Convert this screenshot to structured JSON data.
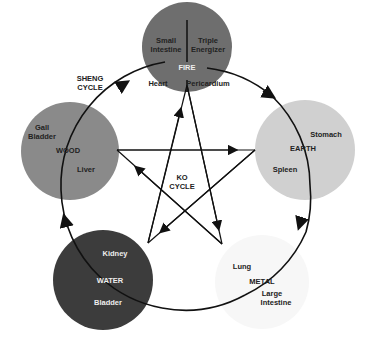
{
  "colors": {
    "fire": "#6e6e6e",
    "wood": "#8a8a8a",
    "earth": "#d0d0d0",
    "water": "#3c3c3c",
    "metal": "#f7f7f7",
    "line": "#111111",
    "dark_text": "#222222",
    "light_text": "#f2f2f2"
  },
  "cycles": {
    "sheng": {
      "line1": "SHENG",
      "line2": "CYCLE"
    },
    "ko": {
      "line1": "KO",
      "line2": "CYCLE"
    }
  },
  "elements": {
    "fire": {
      "name": "FIRE",
      "organs": [
        "Small",
        "Intestine",
        "Triple",
        "Energizer",
        "Heart",
        "Pericardium"
      ]
    },
    "earth": {
      "name": "EARTH",
      "organs": [
        "Stomach",
        "Spleen"
      ]
    },
    "metal": {
      "name": "METAL",
      "organs": [
        "Lung",
        "Large",
        "Intestine"
      ]
    },
    "water": {
      "name": "WATER",
      "organs": [
        "Kidney",
        "Bladder"
      ]
    },
    "wood": {
      "name": "WOOD",
      "organs": [
        "Gall",
        "Bladder",
        "Liver"
      ]
    }
  }
}
